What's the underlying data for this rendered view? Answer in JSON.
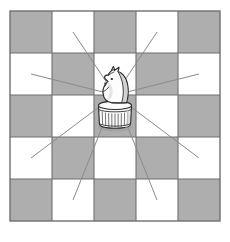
{
  "figure": {
    "caption": ""
  },
  "board": {
    "name": "chessboard",
    "rows": 5,
    "cols": 5,
    "origin_x": 10,
    "origin_y": 11,
    "square_size": 42,
    "light_color": "#ffffff",
    "dark_color": "#aeaeae",
    "grid_line_color": "#6f6f6f",
    "grid_line_width": 1.1,
    "border_color": "#6f6f6f",
    "border_width": 1.4,
    "dark_at_even_sum": true,
    "squares": [
      [
        "dark",
        "light",
        "dark",
        "light",
        "dark"
      ],
      [
        "light",
        "dark",
        "light",
        "dark",
        "light"
      ],
      [
        "dark",
        "light",
        "dark",
        "light",
        "dark"
      ],
      [
        "light",
        "dark",
        "light",
        "dark",
        "light"
      ],
      [
        "dark",
        "light",
        "dark",
        "light",
        "dark"
      ]
    ]
  },
  "piece": {
    "name": "white-knight",
    "type": "knight",
    "color": "white",
    "square_row": 3,
    "square_col": 3,
    "center_x": 115,
    "center_y": 95,
    "body_fill": "#fdfdfd",
    "outline_color": "#2b2b2b",
    "shade_color": "#b8b8b8"
  },
  "move_lines": {
    "name": "knight-move-lines",
    "count": 8,
    "color": "#8a8a8a",
    "width": 1.0,
    "origin_x": 115,
    "origin_y": 95,
    "targets": [
      {
        "label": "up-left",
        "row": 1,
        "col": 2,
        "x": 73,
        "y": 32
      },
      {
        "label": "up-right",
        "row": 1,
        "col": 4,
        "x": 157,
        "y": 32
      },
      {
        "label": "left-up",
        "row": 2,
        "col": 1,
        "x": 31,
        "y": 74
      },
      {
        "label": "right-up",
        "row": 2,
        "col": 5,
        "x": 199,
        "y": 74
      },
      {
        "label": "left-down",
        "row": 4,
        "col": 1,
        "x": 31,
        "y": 158
      },
      {
        "label": "right-down",
        "row": 4,
        "col": 5,
        "x": 199,
        "y": 158
      },
      {
        "label": "down-left",
        "row": 5,
        "col": 2,
        "x": 73,
        "y": 200
      },
      {
        "label": "down-right",
        "row": 5,
        "col": 4,
        "x": 157,
        "y": 200
      }
    ]
  }
}
